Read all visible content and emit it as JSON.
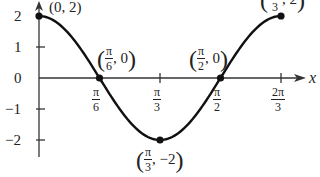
{
  "chart_data": {
    "type": "line",
    "title": "",
    "function": "y = 2cos(3x)",
    "xlabel": "x",
    "ylabel": "",
    "xlim": [
      0,
      2.0944
    ],
    "ylim": [
      -2,
      2
    ],
    "grid": false,
    "legend": null,
    "x_ticks": [
      {
        "value": 0.5236,
        "num": "π",
        "den": "6"
      },
      {
        "value": 1.0472,
        "num": "π",
        "den": "3"
      },
      {
        "value": 1.5708,
        "num": "π",
        "den": "2"
      },
      {
        "value": 2.0944,
        "num": "2π",
        "den": "3"
      }
    ],
    "y_ticks": [
      {
        "value": 2,
        "label": "2"
      },
      {
        "value": 1,
        "label": "1"
      },
      {
        "value": 0,
        "label": "0"
      },
      {
        "value": -1,
        "label": "−1"
      },
      {
        "value": -2,
        "label": "−2"
      }
    ],
    "series": [
      {
        "name": "2cos(3x)",
        "x": [
          0,
          0.5236,
          1.0472,
          1.5708,
          2.0944
        ],
        "values": [
          2,
          0,
          -2,
          0,
          2
        ]
      }
    ],
    "annotations": [
      {
        "point": [
          0,
          2
        ],
        "text_plain": "(0, 2)"
      },
      {
        "point": [
          0.5236,
          0
        ],
        "num": "π",
        "den": "6",
        "rest": ", 0"
      },
      {
        "point": [
          1.5708,
          0
        ],
        "num": "π",
        "den": "2",
        "rest": ", 0"
      },
      {
        "point": [
          1.0472,
          -2
        ],
        "num": "π",
        "den": "3",
        "rest": ", −2"
      },
      {
        "point": [
          2.0944,
          2
        ],
        "num": "2π",
        "den": "3",
        "rest": ", 2"
      }
    ]
  }
}
